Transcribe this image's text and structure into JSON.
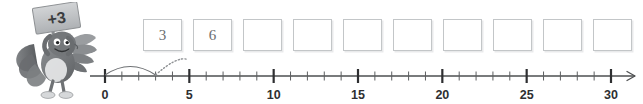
{
  "mascot": {
    "name": "turkey-with-sign",
    "sign_label": "+3",
    "description": "cartoon turkey holding a placard"
  },
  "boxes": {
    "count": 10,
    "values": [
      "3",
      "6",
      "",
      "",
      "",
      "",
      "",
      "",
      "",
      ""
    ]
  },
  "numberline": {
    "min": 0,
    "max": 30,
    "major_step": 5,
    "minor_step": 1,
    "labels": [
      "0",
      "5",
      "10",
      "15",
      "20",
      "25",
      "30"
    ],
    "label_values": [
      0,
      5,
      10,
      15,
      20,
      25,
      30
    ],
    "has_right_arrow": true,
    "jumps": [
      {
        "from": 0,
        "to": 3,
        "style": "solid"
      },
      {
        "from": 3,
        "to": 6,
        "style": "dotted",
        "partial": true
      }
    ]
  },
  "colors": {
    "axis": "#4d4f51",
    "tick_major": "#2e2f31",
    "tick_minor": "#5c5e60",
    "box_border": "#c3c6c8",
    "box_text": "#6a6d70",
    "jump_solid": "#6f7275",
    "jump_dotted": "#8e9194"
  }
}
